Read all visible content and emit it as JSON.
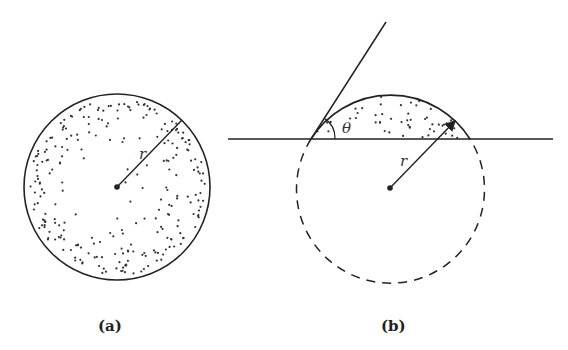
{
  "figure": {
    "panels": [
      {
        "id": "a",
        "label": "(a)",
        "description": "Full circle of radius r, uniformly stippled, with radius line from center",
        "radius_label": "r"
      },
      {
        "id": "b",
        "label": "(b)",
        "description": "Spherical cap (stippled) above a horizontal line; dashed circle completes the sphere; tangent line forms contact angle theta; arrow indicates radius r",
        "radius_label": "r",
        "angle_label": "θ"
      }
    ],
    "colors": {
      "stroke": "#222222",
      "background": "#ffffff"
    }
  }
}
